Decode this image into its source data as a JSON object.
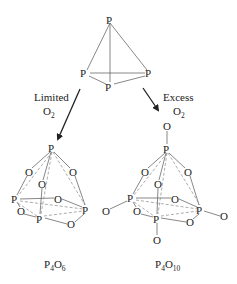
{
  "diagram": {
    "reactant": {
      "name": "P4 tetrahedron",
      "atom_label": "P",
      "atoms": [
        {
          "id": "top",
          "x": 110,
          "y": 20
        },
        {
          "id": "left",
          "x": 85,
          "y": 73
        },
        {
          "id": "right",
          "x": 149,
          "y": 73
        },
        {
          "id": "front",
          "x": 110,
          "y": 87
        }
      ]
    },
    "arrows": [
      {
        "id": "limited",
        "condition_line1": "Limited",
        "condition_line2_base": "O",
        "condition_line2_sub": "2"
      },
      {
        "id": "excess",
        "condition_line1": "Excess",
        "condition_line2_base": "O",
        "condition_line2_sub": "2"
      }
    ],
    "products": [
      {
        "id": "p4o6",
        "formula_parts": [
          {
            "base": "P",
            "sub": "4"
          },
          {
            "base": "O",
            "sub": "6"
          }
        ],
        "p_label": "P",
        "o_label": "O"
      },
      {
        "id": "p4o10",
        "formula_parts": [
          {
            "base": "P",
            "sub": "4"
          },
          {
            "base": "O",
            "sub": "10"
          }
        ],
        "p_label": "P",
        "o_label": "O"
      }
    ],
    "colors": {
      "ink": "#222222",
      "bond": "#555555",
      "dashed_bond": "#888888",
      "background": "#ffffff"
    }
  }
}
